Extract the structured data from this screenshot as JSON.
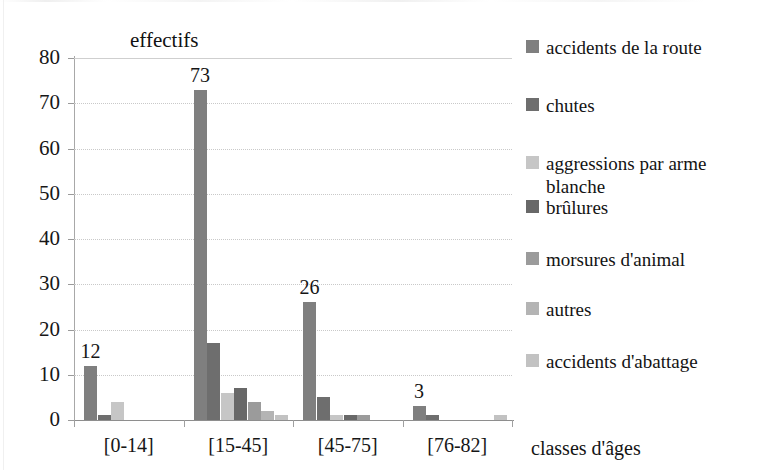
{
  "chart_data": {
    "type": "bar",
    "title": "effectifs",
    "xlabel": "classes d'âges",
    "ylabel": "",
    "ylim": [
      0,
      80
    ],
    "ytick_step": 10,
    "yticks": [
      "0",
      "10",
      "20",
      "30",
      "40",
      "50",
      "60",
      "70",
      "80"
    ],
    "grid": true,
    "legend_position": "right",
    "categories": [
      "[0-14]",
      "[15-45]",
      "[45-75]",
      "[76-82]"
    ],
    "series": [
      {
        "name": "accidents de la route",
        "color": "#7f7f7f",
        "values": [
          12,
          73,
          26,
          3
        ]
      },
      {
        "name": "chutes",
        "color": "#6e6e6e",
        "values": [
          1,
          17,
          5,
          1
        ]
      },
      {
        "name": "aggressions par arme blanche",
        "color": "#c6c6c6",
        "values": [
          4,
          6,
          1,
          0
        ]
      },
      {
        "name": "brûlures",
        "color": "#686868",
        "values": [
          0,
          7,
          1,
          0
        ]
      },
      {
        "name": "morsures d'animal",
        "color": "#9b9b9b",
        "values": [
          0,
          4,
          1,
          0
        ]
      },
      {
        "name": "autres",
        "color": "#b4b4b4",
        "values": [
          0,
          2,
          0,
          0
        ]
      },
      {
        "name": "accidents d'abattage",
        "color": "#c2c2c2",
        "values": [
          0,
          1,
          0,
          1
        ]
      }
    ],
    "data_labels": [
      {
        "category": "[0-14]",
        "series": "accidents de la route",
        "text": "12"
      },
      {
        "category": "[15-45]",
        "series": "accidents de la route",
        "text": "73"
      },
      {
        "category": "[45-75]",
        "series": "accidents de la route",
        "text": "26"
      },
      {
        "category": "[76-82]",
        "series": "accidents de la route",
        "text": "3"
      }
    ]
  },
  "legend": {
    "items": [
      {
        "label": "accidents de la route",
        "color": "#7f7f7f"
      },
      {
        "label": "chutes",
        "color": "#6e6e6e"
      },
      {
        "label": "aggressions par arme blanche",
        "color": "#c6c6c6"
      },
      {
        "label": "brûlures",
        "color": "#686868"
      },
      {
        "label": "morsures d'animal",
        "color": "#9b9b9b"
      },
      {
        "label": "autres",
        "color": "#b4b4b4"
      },
      {
        "label": "accidents d'abattage",
        "color": "#c2c2c2"
      }
    ]
  }
}
